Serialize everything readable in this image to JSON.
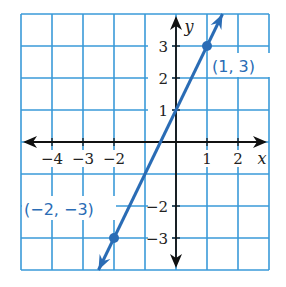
{
  "chart_data": {
    "type": "line",
    "title": "",
    "xlabel": "x",
    "ylabel": "y",
    "xlim": [
      -5,
      3
    ],
    "ylim": [
      -4,
      4
    ],
    "grid": true,
    "x_ticks": [
      -4,
      -3,
      -2,
      1,
      2
    ],
    "x_tick_labels": [
      "−4",
      "−3",
      "−2",
      "1",
      "2"
    ],
    "y_ticks": [
      3,
      2,
      1,
      -2,
      -3
    ],
    "y_tick_labels": [
      "3",
      "2",
      "1",
      "−2",
      "−3"
    ],
    "series": [
      {
        "name": "line through (-2,-3) and (1,3)",
        "equation": "y = 2x + 1",
        "slope": 2,
        "y_intercept": 1,
        "arrows": "both",
        "x": [
          -2.5,
          1.5
        ],
        "y": [
          -4,
          4
        ]
      }
    ],
    "points": [
      {
        "x": -2,
        "y": -3,
        "label": "(−2, −3)"
      },
      {
        "x": 1,
        "y": 3,
        "label": "(1, 3)"
      }
    ]
  },
  "colors": {
    "grid": "#3a9ad9",
    "line": "#2a6cb5",
    "axes": "#111111",
    "text": "#222222"
  }
}
